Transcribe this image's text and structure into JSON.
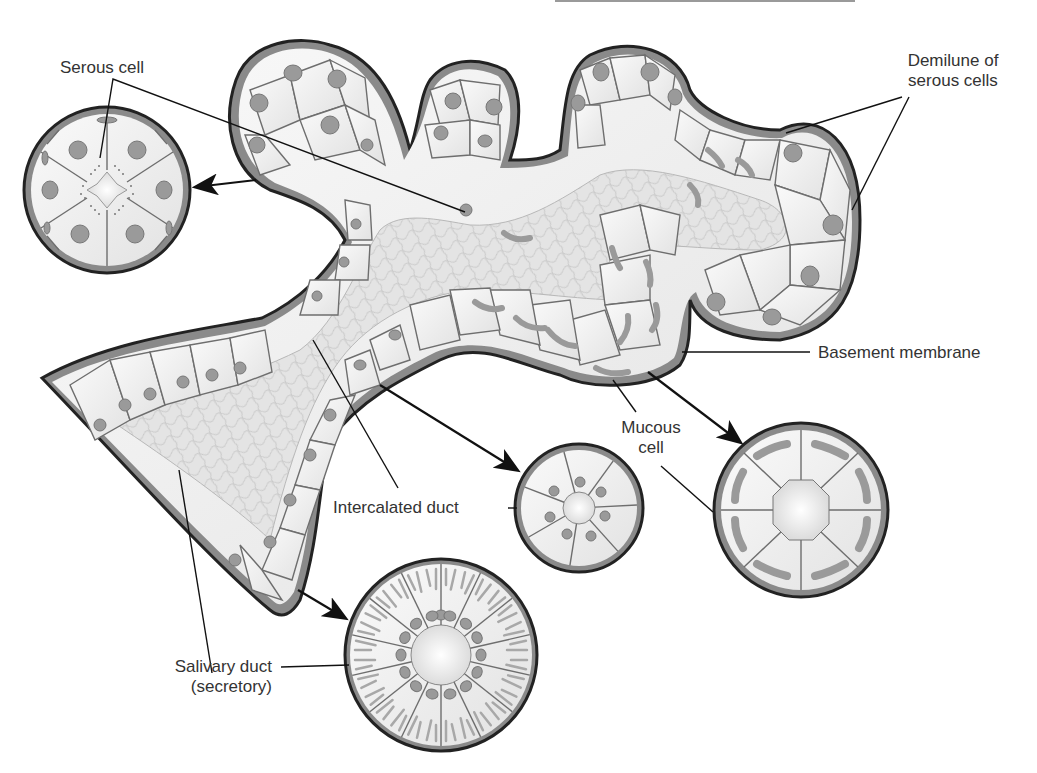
{
  "diagram": {
    "colors": {
      "background": "#ffffff",
      "cell_fill": "#f0f0f0",
      "cell_outline": "#6e6e6e",
      "nucleus": "#9a9a9a",
      "basement_membrane": "#8a8a8a",
      "outer_outline": "#222222",
      "lumen_network": "#d8d8d8",
      "label_text": "#333333",
      "leader_line": "#111111"
    }
  },
  "labels": {
    "serous_cell": "Serous cell",
    "demilune_line1": "Demilune of",
    "demilune_line2": "serous cells",
    "basement_membrane": "Basement membrane",
    "mucous_line1": "Mucous",
    "mucous_line2": "cell",
    "intercalated_duct": "Intercalated duct",
    "salivary_duct_line1": "Salivary duct",
    "salivary_duct_line2": "(secretory)"
  },
  "cross_sections": [
    {
      "name": "serous-acinus",
      "cells": 6,
      "nucleus_shape": "round",
      "secretory_granules": true
    },
    {
      "name": "intercalated-duct",
      "cells": 7,
      "nucleus_shape": "round"
    },
    {
      "name": "mucous-acinus",
      "cells": 8,
      "nucleus_shape": "flattened-basal"
    },
    {
      "name": "striated-salivary-duct",
      "cells": 14,
      "nucleus_shape": "round",
      "basal_striations": true
    }
  ]
}
